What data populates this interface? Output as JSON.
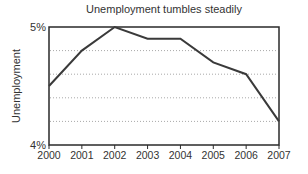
{
  "chart_data": {
    "type": "line",
    "title": "Unemployment tumbles steadily",
    "xlabel": "",
    "ylabel": "Unemployment",
    "categories": [
      "2000",
      "2001",
      "2002",
      "2003",
      "2004",
      "2005",
      "2006",
      "2007"
    ],
    "values": [
      4.5,
      4.8,
      5.0,
      4.9,
      4.9,
      4.7,
      4.6,
      4.2
    ],
    "ylim": [
      4,
      5
    ],
    "y_tick_labels": [
      {
        "value": 5,
        "label": "5%"
      },
      {
        "value": 4,
        "label": "4%"
      }
    ],
    "gridline_values": [
      4.8,
      4.6,
      4.4,
      4.2
    ],
    "grid": "horizontal-dotted",
    "legend": "none",
    "colors": {
      "line": "#3a3a3a",
      "frame": "#2a2a2a",
      "grid": "#a8a8a8",
      "text": "#333333",
      "background": "#ffffff"
    }
  }
}
